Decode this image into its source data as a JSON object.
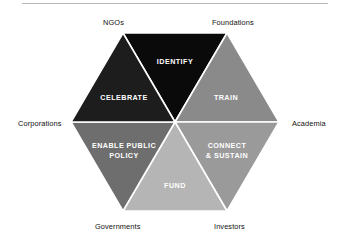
{
  "diagram": {
    "type": "hexagon-segment-wheel",
    "segments": [
      {
        "id": "identify",
        "label": "IDENTIFY",
        "lines": [
          "IDENTIFY"
        ],
        "color": "#0a0a0a",
        "text_color": "#ffffff",
        "position": "top"
      },
      {
        "id": "train",
        "label": "TRAIN",
        "lines": [
          "TRAIN"
        ],
        "color": "#8a8a8a",
        "text_color": "#ffffff",
        "position": "upper-right"
      },
      {
        "id": "connect",
        "label": "CONNECT & SUSTAIN",
        "lines": [
          "CONNECT",
          "& SUSTAIN"
        ],
        "color": "#9a9a9a",
        "text_color": "#ffffff",
        "position": "lower-right"
      },
      {
        "id": "fund",
        "label": "FUND",
        "lines": [
          "FUND"
        ],
        "color": "#b5b5b5",
        "text_color": "#ffffff",
        "position": "bottom"
      },
      {
        "id": "policy",
        "label": "ENABLE PUBLIC POLICY",
        "lines": [
          "ENABLE PUBLIC",
          "POLICY"
        ],
        "color": "#6e6e6e",
        "text_color": "#ffffff",
        "position": "lower-left"
      },
      {
        "id": "celebrate",
        "label": "CELEBRATE",
        "lines": [
          "CELEBRATE"
        ],
        "color": "#1d1d1d",
        "text_color": "#ffffff",
        "position": "upper-left"
      }
    ],
    "nodes": [
      {
        "id": "ngos",
        "label": "NGOs",
        "vertex": "top-left"
      },
      {
        "id": "foundations",
        "label": "Foundations",
        "vertex": "top-right"
      },
      {
        "id": "academia",
        "label": "Academia",
        "vertex": "right"
      },
      {
        "id": "investors",
        "label": "Investors",
        "vertex": "bottom-right"
      },
      {
        "id": "governments",
        "label": "Governments",
        "vertex": "bottom-left"
      },
      {
        "id": "corporations",
        "label": "Corporations",
        "vertex": "left"
      }
    ],
    "divider_color": "#ffffff",
    "background_color": "#ffffff",
    "rule_color": "#b8b8b8"
  }
}
